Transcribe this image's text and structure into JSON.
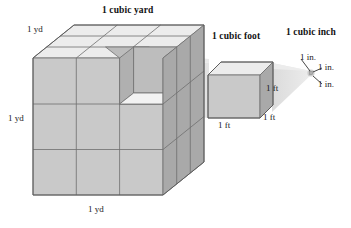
{
  "figure": {
    "kind": "volume-units-comparison-diagram",
    "headings": {
      "cubic_yard": "1 cubic yard",
      "cubic_foot": "1 cubic foot",
      "cubic_inch": "1 cubic inch"
    },
    "yard_cube": {
      "label_top": "1 yd",
      "label_left": "1 yd",
      "label_bottom": "1 yd",
      "divisions_per_edge": 3,
      "notch": "one unit cube removed at top-front-right corner"
    },
    "foot_cube": {
      "label_right": "1 ft",
      "label_bottom_right": "1 ft",
      "label_bottom": "1 ft"
    },
    "inch_cube": {
      "label_1": "1 in.",
      "label_2": "1 in.",
      "label_3": "1 in."
    },
    "colors": {
      "top_face": "#ececec",
      "front_face": "#c9c9c9",
      "side_face": "#a9a9a9",
      "notch_floor": "#f2f2f2",
      "band": "#d8d8d8",
      "stroke": "#6e6e6e",
      "text": "#111111",
      "background": "#ffffff"
    }
  }
}
